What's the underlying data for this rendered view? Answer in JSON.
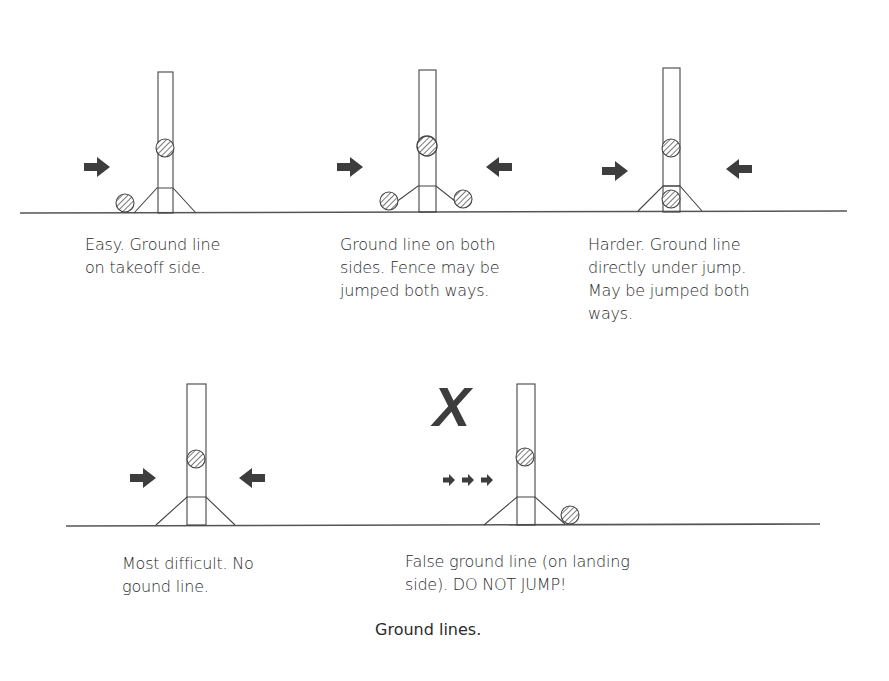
{
  "figure": {
    "title": "Ground lines."
  },
  "panels": [
    {
      "id": "easy",
      "caption": "Easy. Ground line\non takeoff side.",
      "arrows": "one-left",
      "ground_line": "takeoff side"
    },
    {
      "id": "both-sides",
      "caption": "Ground line on both\nsides. Fence may be\njumped both ways.",
      "arrows": "both",
      "ground_line": "both sides"
    },
    {
      "id": "harder",
      "caption": "Harder. Ground line\ndirectly under jump.\nMay be jumped both\nways.",
      "arrows": "both",
      "ground_line": "directly under"
    },
    {
      "id": "most-difficult",
      "caption": "Most difficult. No\ngound line.",
      "arrows": "both",
      "ground_line": "none"
    },
    {
      "id": "false-ground-line",
      "caption": "False ground line (on landing\nside). DO NOT JUMP!",
      "arrows": "three-small",
      "ground_line": "landing side",
      "mark": "X"
    }
  ],
  "colors": {
    "ink": "#3a3a3a",
    "arrow": "#3d3d3d",
    "ground": "#555555",
    "background": "#ffffff"
  }
}
